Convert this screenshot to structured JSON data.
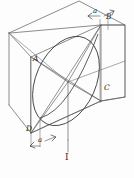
{
  "figure": {
    "name": "isometric-box-with-inscribed-ellipse",
    "caption": "I",
    "stroke_color": "#5a5a5a",
    "curve_color": "#3f3f3f",
    "label_color": "#2b2b2b",
    "background_color": "#fdfdfd"
  },
  "vertex_labels": [
    {
      "id": "A",
      "text": "A",
      "x": 33,
      "y": 60
    },
    {
      "id": "B",
      "text": "B",
      "x": 106,
      "y": 17
    },
    {
      "id": "C",
      "text": "C",
      "x": 104,
      "y": 88
    },
    {
      "id": "D",
      "text": "D",
      "x": 28,
      "y": 130
    }
  ],
  "dimension_labels": [
    {
      "id": "a-top",
      "text": "a",
      "x": 93,
      "y": 11
    },
    {
      "id": "a-bottom",
      "text": "a",
      "x": 39,
      "y": 141
    }
  ],
  "figure_label": {
    "text": "I",
    "x": 67,
    "y": 160
  },
  "geometry": {
    "box_front_top_left": [
      31,
      57
    ],
    "box_front_top_right": [
      101,
      25
    ],
    "box_front_bottom_left": [
      31,
      133
    ],
    "box_front_bottom_right": [
      101,
      101
    ],
    "box_back_top_left": [
      9,
      33
    ],
    "box_back_top_right": [
      125,
      33
    ],
    "center_point": [
      68,
      82
    ],
    "ellipse_center": [
      66,
      81
    ],
    "ellipse_rx": 30,
    "ellipse_ry": 47,
    "ellipse_rotation_deg": 24
  }
}
